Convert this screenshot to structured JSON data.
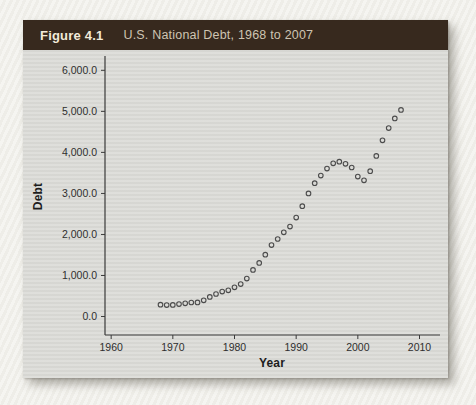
{
  "figure": {
    "label": "Figure 4.1",
    "title": "U.S. National Debt, 1968 to 2007"
  },
  "colors": {
    "page_background": "#f2f1ec",
    "panel_background": "#dbdbd7",
    "titlebar_background": "#37291e",
    "figure_label_text": "#f2ead9",
    "figure_title_text": "#cec4b2",
    "axis_color": "#3a3a3a",
    "tick_text_color": "#2e2e2e",
    "marker_color": "#4c4c4c"
  },
  "chart_data": {
    "type": "scatter",
    "title": "U.S. National Debt, 1968 to 2007",
    "xlabel": "Year",
    "ylabel": "Debt",
    "grid": false,
    "legend": "none",
    "marker": "open-circle",
    "x_range": [
      1959,
      2013
    ],
    "y_range": [
      -450,
      6300
    ],
    "x_ticks": [
      1960,
      1970,
      1980,
      1990,
      2000,
      2010
    ],
    "y_ticks": [
      {
        "value": 0,
        "label": "0.0"
      },
      {
        "value": 1000,
        "label": "1,000.0"
      },
      {
        "value": 2000,
        "label": "2,000.0"
      },
      {
        "value": 3000,
        "label": "3,000.0"
      },
      {
        "value": 4000,
        "label": "4,000.0"
      },
      {
        "value": 5000,
        "label": "5,000.0"
      },
      {
        "value": 6000,
        "label": "6,000.0"
      }
    ],
    "x": [
      1968,
      1969,
      1970,
      1971,
      1972,
      1973,
      1974,
      1975,
      1976,
      1977,
      1978,
      1979,
      1980,
      1981,
      1982,
      1983,
      1984,
      1985,
      1986,
      1987,
      1988,
      1989,
      1990,
      1991,
      1992,
      1993,
      1994,
      1995,
      1996,
      1997,
      1998,
      1999,
      2000,
      2001,
      2002,
      2003,
      2004,
      2005,
      2006,
      2007
    ],
    "y": [
      289.5,
      278.1,
      283.2,
      303.0,
      322.4,
      340.9,
      343.7,
      394.7,
      477.4,
      549.1,
      607.1,
      640.3,
      711.9,
      789.4,
      924.6,
      1137.3,
      1307.0,
      1507.3,
      1740.6,
      1889.8,
      2051.6,
      2190.7,
      2411.6,
      2689.0,
      2999.7,
      3248.4,
      3433.1,
      3604.4,
      3734.1,
      3772.3,
      3721.1,
      3632.4,
      3409.8,
      3319.6,
      3540.4,
      3913.4,
      4295.5,
      4592.2,
      4829.0,
      5035.1
    ]
  }
}
